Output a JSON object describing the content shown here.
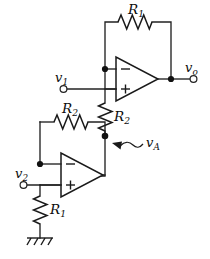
{
  "diagram": {
    "background_color": "#ffffff",
    "line_color": "#1a1a1a"
  },
  "labels": {
    "r1_top": {
      "symbol": "R",
      "subscript": "1"
    },
    "r1_bottom": {
      "symbol": "R",
      "subscript": "1"
    },
    "r2_horizontal": {
      "symbol": "R",
      "subscript": "2"
    },
    "r2_vertical": {
      "symbol": "R",
      "subscript": "2"
    },
    "v1": {
      "symbol": "v",
      "subscript": "1"
    },
    "v2": {
      "symbol": "v",
      "subscript": "2"
    },
    "vo": {
      "symbol": "v",
      "subscript": "o"
    },
    "va": {
      "symbol": "v",
      "subscript": "A"
    }
  },
  "opamps": [
    {
      "id": "top-opamp",
      "inverting_sign": "−",
      "noninverting_sign": "+",
      "inverting_position": "top",
      "noninverting_position": "bottom"
    },
    {
      "id": "bottom-opamp",
      "inverting_sign": "−",
      "noninverting_sign": "+",
      "inverting_position": "top",
      "noninverting_position": "bottom"
    }
  ],
  "components": [
    {
      "id": "r1-top",
      "type": "resistor",
      "orientation": "horizontal",
      "label": "R1"
    },
    {
      "id": "r2-vertical",
      "type": "resistor",
      "orientation": "vertical",
      "label": "R2"
    },
    {
      "id": "r2-horizontal",
      "type": "resistor",
      "orientation": "horizontal",
      "label": "R2"
    },
    {
      "id": "r1-bottom",
      "type": "resistor",
      "orientation": "vertical",
      "label": "R1"
    },
    {
      "id": "ground",
      "type": "ground",
      "style": "hatched"
    }
  ],
  "terminals": [
    {
      "id": "v1-terminal",
      "label": "v1",
      "style": "open-circle"
    },
    {
      "id": "v2-terminal",
      "label": "v2",
      "style": "open-circle"
    },
    {
      "id": "vo-terminal",
      "label": "vo",
      "style": "open-circle"
    }
  ],
  "nodes": [
    {
      "id": "top-inverting-node",
      "style": "filled-dot"
    },
    {
      "id": "output-node",
      "style": "filled-dot"
    },
    {
      "id": "va-node",
      "style": "filled-dot"
    },
    {
      "id": "bottom-inverting-node",
      "style": "filled-dot"
    }
  ],
  "annotations": [
    {
      "id": "va-pointer",
      "type": "curved-arrow",
      "points_to": "va-node",
      "label": "vA"
    }
  ]
}
